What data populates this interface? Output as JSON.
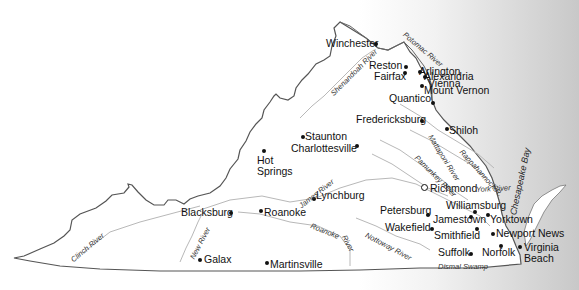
{
  "map": {
    "title": "Virginia",
    "cities": [
      {
        "name": "Winchester",
        "x": 326,
        "y": 39,
        "dx": 375,
        "dy": 43
      },
      {
        "name": "Vienna",
        "x": 428,
        "y": 80,
        "dx": 424,
        "dy": 82
      },
      {
        "name": "Reston",
        "x": 369,
        "y": 83,
        "dx": 405,
        "dy": 66
      },
      {
        "name": "Arlington",
        "x": 419,
        "y": 87,
        "dx": 431,
        "dy": 71
      },
      {
        "name": "Fairfax",
        "x": 375,
        "y": 97,
        "dx": 404,
        "dy": 72
      },
      {
        "name": "Alexandria",
        "x": 424,
        "y": 99,
        "dx": 430,
        "dy": 76
      },
      {
        "name": "Mount Vernon",
        "x": 424,
        "y": 113,
        "dx": 432,
        "dy": 84
      },
      {
        "name": "Quantico",
        "x": 389,
        "y": 124,
        "dx": 432,
        "dy": 102
      },
      {
        "name": "Fredericksburg",
        "x": 356,
        "y": 145,
        "dx": 421,
        "dy": 120
      },
      {
        "name": "Shiloh",
        "x": 450,
        "y": 158,
        "dx": 446,
        "dy": 128
      },
      {
        "name": "Staunton",
        "x": 305,
        "y": 131,
        "dx": 302,
        "dy": 136
      },
      {
        "name": "Charlottesville",
        "x": 291,
        "y": 144,
        "dx": 356,
        "dy": 145
      },
      {
        "name": "Hot",
        "x": 257,
        "y": 150,
        "dx": 263,
        "dy": 150
      },
      {
        "name": "Springs",
        "x": 257,
        "y": 161,
        "dx": null,
        "dy": null
      },
      {
        "name": "Lynchburg",
        "x": 316,
        "y": 191,
        "dx": 313,
        "dy": 198
      },
      {
        "name": "Richmond",
        "x": 433,
        "y": 186,
        "dx": 424,
        "dy": 188,
        "capital": true
      },
      {
        "name": "Williamsburg",
        "x": 446,
        "y": 203,
        "dx": 474,
        "dy": 211
      },
      {
        "name": "Petersburg",
        "x": 380,
        "y": 210,
        "dx": 427,
        "dy": 214
      },
      {
        "name": "Jamestown",
        "x": 433,
        "y": 219,
        "dx": 470,
        "dy": 216
      },
      {
        "name": "Yorktown",
        "x": 490,
        "y": 219,
        "dx": 486,
        "dy": 214
      },
      {
        "name": "Wakefield",
        "x": 390,
        "y": 225,
        "dx": 430,
        "dy": 228
      },
      {
        "name": "Smithfield",
        "x": 434,
        "y": 232,
        "dx": 475,
        "dy": 228
      },
      {
        "name": "Newport News",
        "x": 496,
        "y": 236,
        "dx": 491,
        "dy": 232
      },
      {
        "name": "Blacksburg",
        "x": 181,
        "y": 210,
        "dx": 229,
        "dy": 212
      },
      {
        "name": "Roanoke",
        "x": 263,
        "y": 210,
        "dx": 259,
        "dy": 210
      },
      {
        "name": "Suffolk",
        "x": 438,
        "y": 250,
        "dx": 470,
        "dy": 253
      },
      {
        "name": "Norfolk",
        "x": 482,
        "y": 250,
        "dx": 500,
        "dy": 245
      },
      {
        "name": "Virginia",
        "x": 521,
        "y": 243,
        "dx": 518,
        "dy": 246
      },
      {
        "name": "Beach",
        "x": 524,
        "y": 254,
        "dx": null,
        "dy": null
      },
      {
        "name": "Galax",
        "x": 204,
        "y": 254,
        "dx": 199,
        "dy": 259
      },
      {
        "name": "Martinsville",
        "x": 270,
        "y": 260,
        "dx": 265,
        "dy": 262
      }
    ],
    "rivers": [
      {
        "name": "Potomac River",
        "x": 404,
        "y": 30,
        "angle": 40
      },
      {
        "name": "Shenandoah River",
        "x": 330,
        "y": 90,
        "angle": -45
      },
      {
        "name": "James River",
        "x": 298,
        "y": 196,
        "angle": -38
      },
      {
        "name": "Mattaponi River",
        "x": 430,
        "y": 136,
        "angle": 55
      },
      {
        "name": "Pamunkey River",
        "x": 415,
        "y": 153,
        "angle": 45
      },
      {
        "name": "Rappahannock R.",
        "x": 460,
        "y": 147,
        "angle": 50
      },
      {
        "name": "York River",
        "x": 476,
        "y": 187,
        "angle": -5
      },
      {
        "name": "Roanoke",
        "x": 310,
        "y": 222,
        "angle": 22
      },
      {
        "name": "River",
        "x": 343,
        "y": 232,
        "angle": 60
      },
      {
        "name": "Nottoway River",
        "x": 366,
        "y": 230,
        "angle": 28
      },
      {
        "name": "Clinch River",
        "x": 72,
        "y": 253,
        "angle": -40
      },
      {
        "name": "New River",
        "x": 190,
        "y": 245,
        "angle": -62
      },
      {
        "name": "Dismal Swamp",
        "x": 438,
        "y": 263,
        "angle": 0
      }
    ],
    "water": [
      {
        "name": "Chesapeake Bay",
        "x": 513,
        "y": 198,
        "angle": -78
      }
    ]
  }
}
